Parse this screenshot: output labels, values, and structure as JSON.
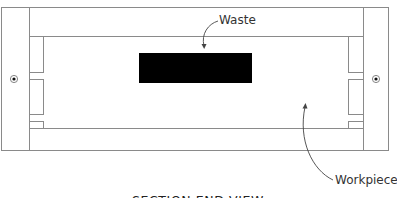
{
  "diagram": {
    "title": "Section end view",
    "labels": {
      "waste": "Waste",
      "workpiece": "Workpiece"
    },
    "caption": "SECTION END VIEW",
    "colors": {
      "line": "#8a8a8a",
      "waste_block": "#000000",
      "text": "#333333",
      "background": "#ffffff"
    },
    "components": [
      {
        "name": "outer-frame",
        "description": "Outer housing outline"
      },
      {
        "name": "left-jaw",
        "description": "Left clamp/jaw with notches and pivot"
      },
      {
        "name": "right-jaw",
        "description": "Right clamp/jaw with notches and pivot"
      },
      {
        "name": "workpiece",
        "description": "Rectangular workpiece between jaws"
      },
      {
        "name": "waste-block",
        "description": "Solid black waste region inside workpiece"
      }
    ]
  }
}
